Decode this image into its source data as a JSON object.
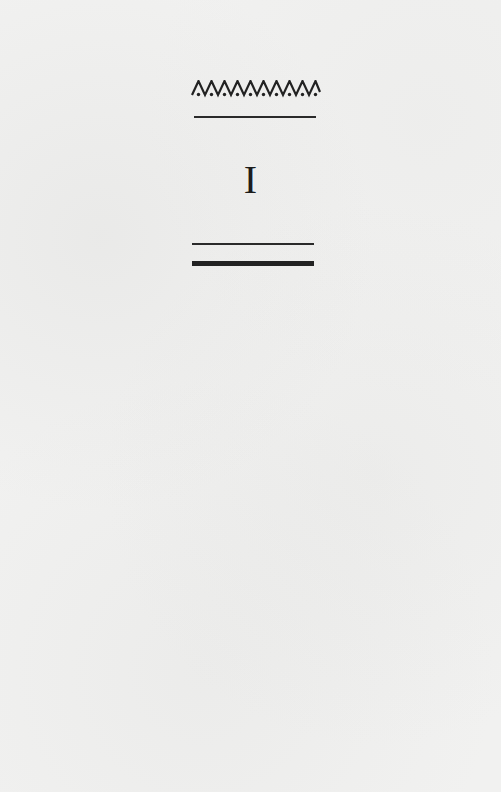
{
  "page": {
    "background_color": "#f1f1f0",
    "ink_color": "#1e1e1e"
  },
  "ornament": {
    "icon": "zigzag-dotted-ornament-icon",
    "peaks": 10,
    "glyph_text": "ΛΛΛΛΛΛΛΛΛΛ"
  },
  "chapter": {
    "number": "I"
  },
  "rules": [
    {
      "position": "above-number",
      "style": "thin"
    },
    {
      "position": "below-number",
      "style": "thin"
    },
    {
      "position": "below-number",
      "style": "thick"
    }
  ]
}
